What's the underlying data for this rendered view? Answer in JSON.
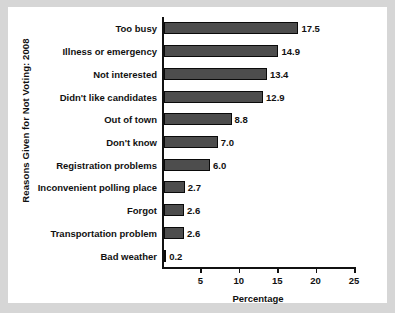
{
  "chart_data": {
    "type": "bar",
    "orientation": "horizontal",
    "title": "",
    "xlabel": "Percentage",
    "ylabel": "Reasons Given for Not Voting: 2008",
    "categories": [
      "Too busy",
      "Illness or emergency",
      "Not interested",
      "Didn't like candidates",
      "Out of town",
      "Don't know",
      "Registration problems",
      "Inconvenient polling place",
      "Forgot",
      "Transportation problem",
      "Bad weather"
    ],
    "values": [
      17.5,
      14.9,
      13.4,
      12.9,
      8.8,
      7.0,
      6.0,
      2.7,
      2.6,
      2.6,
      0.2
    ],
    "value_labels": [
      "17.5",
      "14.9",
      "13.4",
      "12.9",
      "8.8",
      "7.0",
      "6.0",
      "2.7",
      "2.6",
      "2.6",
      "0.2"
    ],
    "xlim": [
      0,
      25
    ],
    "xticks": [
      5,
      10,
      15,
      20,
      25
    ],
    "xtick_labels": [
      "5",
      "10",
      "15",
      "20",
      "25"
    ],
    "grid": false,
    "legend": false,
    "bar_color": "#4d4d4d",
    "bar_edge_color": "#0a0a0a",
    "axis_color": "#111111",
    "background_color": "#ffffff",
    "page_background_color": "#d6d6d6"
  }
}
